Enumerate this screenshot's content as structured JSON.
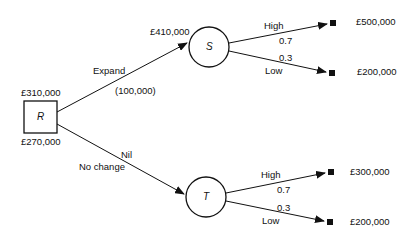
{
  "diagram": {
    "type": "decision-tree",
    "root": {
      "id": "R",
      "label": "R",
      "value_above": "£310,000",
      "value_below": "£270,000"
    },
    "branches": [
      {
        "label": "Expand",
        "cost": "(100,000)",
        "to": "S",
        "node_value": "£410,000"
      },
      {
        "label": "No change",
        "cost": "Nil",
        "to": "T"
      }
    ],
    "chance_nodes": [
      {
        "id": "S",
        "label": "S",
        "outcomes": [
          {
            "label": "High",
            "probability": "0.7",
            "payoff": "£500,000"
          },
          {
            "label": "Low",
            "probability": "0.3",
            "payoff": "£200,000"
          }
        ]
      },
      {
        "id": "T",
        "label": "T",
        "outcomes": [
          {
            "label": "High",
            "probability": "0.7",
            "payoff": "£300,000"
          },
          {
            "label": "Low",
            "probability": "0.3",
            "payoff": "£200,000"
          }
        ]
      }
    ]
  }
}
